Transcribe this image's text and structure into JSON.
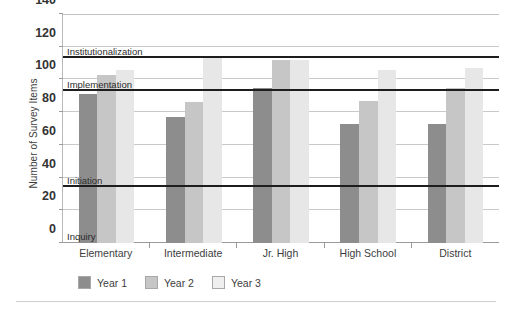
{
  "chart_data": {
    "type": "bar",
    "title": "",
    "xlabel": "",
    "ylabel": "Number of Survey Items",
    "ylim": [
      0,
      140
    ],
    "yticks": [
      0,
      20,
      40,
      60,
      80,
      100,
      120,
      140
    ],
    "grid": true,
    "legend_position": "bottom-left",
    "categories": [
      "Elementary",
      "Intermediate",
      "Jr. High",
      "High School",
      "District"
    ],
    "series": [
      {
        "name": "Year 1",
        "color": "#8d8d8d",
        "values": [
          91,
          77,
          95,
          73,
          73
        ]
      },
      {
        "name": "Year 2",
        "color": "#c6c6c6",
        "values": [
          103,
          86,
          112,
          87,
          95
        ]
      },
      {
        "name": "Year 3",
        "color": "#e7e7e7",
        "values": [
          106,
          113,
          112,
          106,
          107
        ]
      }
    ],
    "threshold_lines": [
      {
        "label": "Institutionalization",
        "value": 113,
        "color": "#1d1d1d"
      },
      {
        "label": "Implementation",
        "value": 93,
        "color": "#1d1d1d"
      },
      {
        "label": "Initiation",
        "value": 34,
        "color": "#1d1d1d"
      },
      {
        "label": "Inquiry",
        "value": 0,
        "color": "#1d1d1d"
      }
    ],
    "annotations": [
      "Institutionalization",
      "Implementation",
      "Initiation",
      "Inquiry"
    ]
  },
  "axis": {
    "y_title": "Number of Survey Items",
    "y_tick_labels": [
      "140",
      "120",
      "100",
      "80",
      "60",
      "40",
      "20",
      "0"
    ]
  },
  "legend": {
    "items": [
      {
        "label": "Year 1",
        "swatch": "year1-swatch"
      },
      {
        "label": "Year 2",
        "swatch": "year2-swatch"
      },
      {
        "label": "Year 3",
        "swatch": "year3-swatch"
      }
    ]
  }
}
